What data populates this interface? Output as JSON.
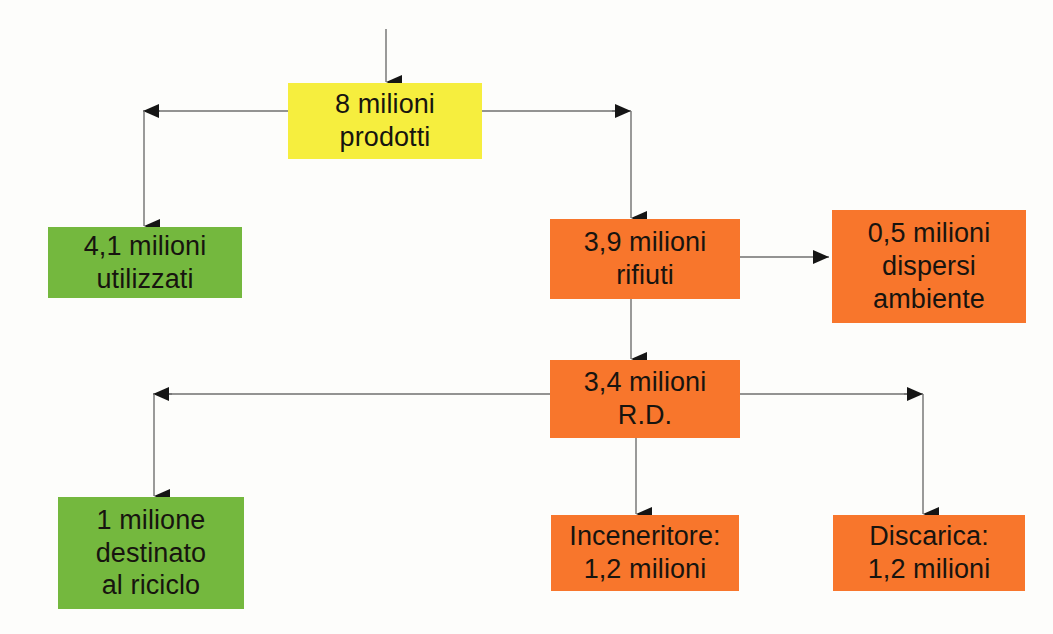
{
  "diagram": {
    "palette": {
      "yellow": "#f6ee3e",
      "green": "#74b83e",
      "orange": "#f8762c",
      "line": "#6f6f6f",
      "arrow": "#151515",
      "text": "#17140f",
      "background": "#fdfdfb"
    },
    "nodes": [
      {
        "id": "prodotti",
        "color": "yellow",
        "text": "8 milioni\nprodotti",
        "x": 288,
        "y": 83,
        "w": 194,
        "h": 76
      },
      {
        "id": "utilizzati",
        "color": "green",
        "text": "4,1 milioni\nutilizzati",
        "x": 48,
        "y": 227,
        "w": 194,
        "h": 71
      },
      {
        "id": "rifiuti",
        "color": "orange",
        "text": "3,9 milioni\nrifiuti",
        "x": 550,
        "y": 219,
        "w": 190,
        "h": 80
      },
      {
        "id": "dispersi",
        "color": "orange",
        "text": "0,5 milioni\ndispersi\nambiente",
        "x": 832,
        "y": 210,
        "w": 194,
        "h": 113
      },
      {
        "id": "rd",
        "color": "orange",
        "text": "3,4 milioni\nR.D.",
        "x": 550,
        "y": 360,
        "w": 190,
        "h": 78
      },
      {
        "id": "riciclo",
        "color": "green",
        "text": "1 milione\ndestinato\nal riciclo",
        "x": 58,
        "y": 497,
        "w": 186,
        "h": 112
      },
      {
        "id": "inceneritore",
        "color": "orange",
        "text": "Inceneritore:\n1,2 milioni",
        "x": 551,
        "y": 515,
        "w": 188,
        "h": 76
      },
      {
        "id": "discarica",
        "color": "orange",
        "text": "Discarica:\n1,2 milioni",
        "x": 833,
        "y": 515,
        "w": 192,
        "h": 76
      }
    ],
    "connectors": [
      {
        "id": "input-to-prodotti",
        "from": "input",
        "to": "prodotti",
        "kind": "arrow-down"
      },
      {
        "id": "prodotti-to-utilizzati",
        "from": "prodotti",
        "to": "utilizzati",
        "kind": "elbow-left"
      },
      {
        "id": "prodotti-to-rifiuti",
        "from": "prodotti",
        "to": "rifiuti",
        "kind": "elbow-right"
      },
      {
        "id": "rifiuti-to-dispersi",
        "from": "rifiuti",
        "to": "dispersi",
        "kind": "arrow-right"
      },
      {
        "id": "rifiuti-to-rd",
        "from": "rifiuti",
        "to": "rd",
        "kind": "arrow-down"
      },
      {
        "id": "rd-to-riciclo",
        "from": "rd",
        "to": "riciclo",
        "kind": "elbow-left"
      },
      {
        "id": "rd-to-inceneritore",
        "from": "rd",
        "to": "inceneritore",
        "kind": "arrow-down"
      },
      {
        "id": "rd-to-discarica",
        "from": "rd",
        "to": "discarica",
        "kind": "elbow-right"
      }
    ]
  }
}
